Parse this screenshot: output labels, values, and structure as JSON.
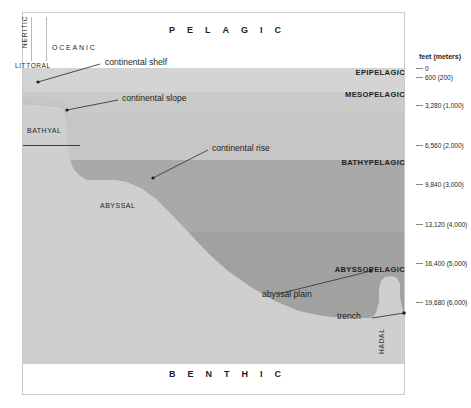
{
  "figure": {
    "title_top": "PELAGIC",
    "title_bottom": "BENTHIC"
  },
  "surface_zones": {
    "neritic": "NERITIC",
    "oceanic": "OCEANIC",
    "littoral": "LITTORAL"
  },
  "pelagic_zones": [
    {
      "label": "EPIPELAGIC",
      "top": 71,
      "color": "#d4d4d4"
    },
    {
      "label": "MESOPELAGIC",
      "top": 92,
      "color": "#c6c6c6"
    },
    {
      "label": "BATHYPELAGIC",
      "top": 160,
      "color": "#a9a9a9"
    },
    {
      "label": "ABYSSOPELAGIC",
      "top": 267,
      "color": "#a0a0a0"
    }
  ],
  "benthic_zones": [
    {
      "label": "BATHYAL",
      "left": 27,
      "top": 127
    },
    {
      "label": "ABYSSAL",
      "left": 100,
      "top": 202
    },
    {
      "label": "HADAL",
      "left": 386,
      "top": 330
    }
  ],
  "callouts": [
    {
      "label": "continental shelf",
      "left": 105,
      "top": 61
    },
    {
      "label": "continental slope",
      "left": 122,
      "top": 97
    },
    {
      "label": "continental rise",
      "left": 212,
      "top": 146
    },
    {
      "label": "abyssal plain",
      "left": 262,
      "top": 296
    },
    {
      "label": "trench",
      "left": 337,
      "top": 316
    }
  ],
  "depth_scale": {
    "header": "feet (meters)",
    "ticks": [
      {
        "label": "0",
        "y": 68
      },
      {
        "label": "600 (200)",
        "y": 77
      },
      {
        "label": "3,280 (1,000)",
        "y": 105
      },
      {
        "label": "6,560 (2,000)",
        "y": 145
      },
      {
        "label": "9,840 (3,000)",
        "y": 184
      },
      {
        "label": "13,120 (4,000)",
        "y": 224
      },
      {
        "label": "16,400 (5,000)",
        "y": 263
      },
      {
        "label": "19,680 (6,000)",
        "y": 302
      }
    ]
  },
  "colors": {
    "epipelagic": "#d4d4d4",
    "mesopelagic": "#c6c6c6",
    "bathypelagic": "#a9a9a9",
    "abyssopelagic": "#a0a0a0",
    "seafloor": "#cfcfcf",
    "slope_face": "#b5b5b5",
    "frame": "#c9c9c9",
    "text": "#231f20"
  }
}
